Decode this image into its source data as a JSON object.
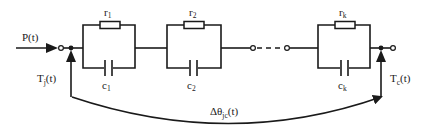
{
  "diagram": {
    "type": "thermal RC network (Foster model)",
    "input": {
      "label": "P(t)"
    },
    "junction_temp": {
      "label_main": "T",
      "label_sub": "j",
      "label_tail": "(t)"
    },
    "case_temp": {
      "label_main": "T",
      "label_sub": "c",
      "label_tail": "(t)"
    },
    "delta": {
      "label_main": "Δθ",
      "label_sub": "jc",
      "label_tail": "(t)"
    },
    "stages": [
      {
        "r_main": "r",
        "r_sub": "1",
        "c_main": "c",
        "c_sub": "1"
      },
      {
        "r_main": "r",
        "r_sub": "2",
        "c_main": "c",
        "c_sub": "2"
      },
      {
        "r_main": "r",
        "r_sub": "k",
        "c_main": "c",
        "c_sub": "k"
      }
    ],
    "colors": {
      "line": "#1a1a1a",
      "background": "#ffffff"
    }
  }
}
